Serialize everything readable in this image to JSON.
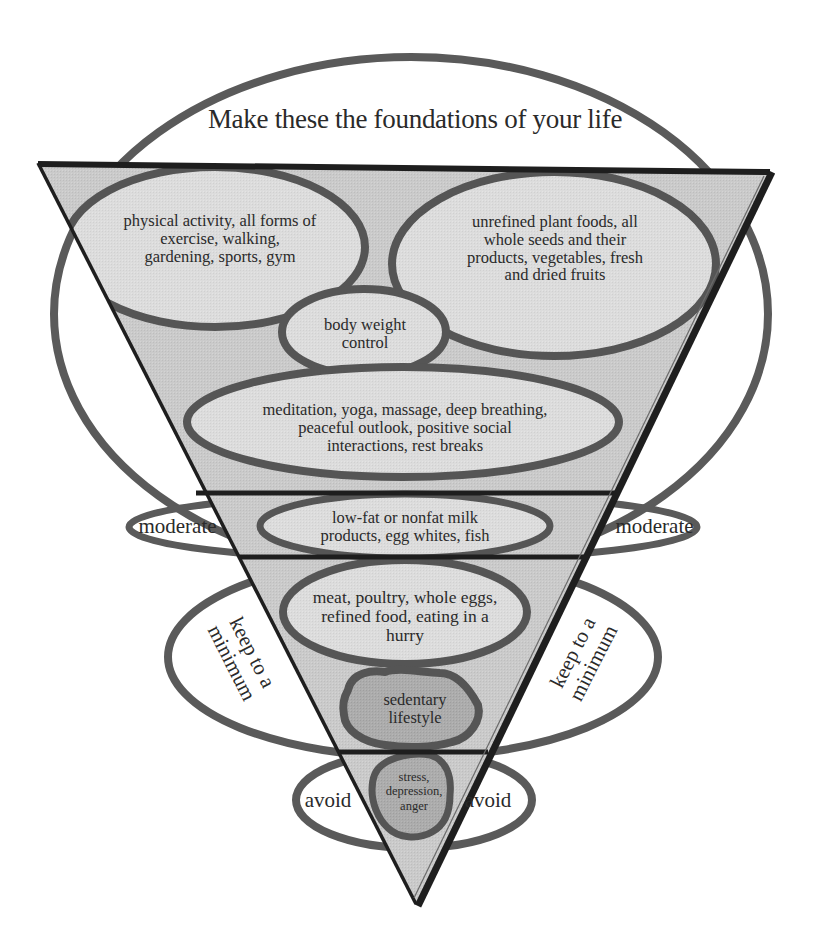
{
  "diagram": {
    "title": "Make these the foundations of your life",
    "colors": {
      "background": "#ffffff",
      "triangle_fill": "#c9c9c9",
      "triangle_edge": "#1e1e1e",
      "ellipse_stroke": "#555555",
      "inner_ellipse_fill": "#dadada",
      "warning_fill": "#a9a9a9",
      "text": "#2a2a2a"
    },
    "zones": [
      {
        "name": "foundations",
        "label": "Make these the foundations of your life",
        "items": [
          "physical activity, all forms of\nexercise, walking,\ngardening, sports, gym",
          "unrefined plant foods, all\nwhole seeds and their\nproducts, vegetables, fresh\nand dried fruits",
          "body weight\ncontrol",
          "meditation, yoga, massage, deep breathing,\npeaceful outlook, positive social\ninteractions, rest breaks"
        ]
      },
      {
        "name": "moderate",
        "side_label_left": "moderate",
        "side_label_right": "moderate",
        "items": [
          "low-fat or nonfat milk\nproducts, egg whites, fish"
        ]
      },
      {
        "name": "keep-to-a-minimum",
        "side_label_left": "keep to a\nminimum",
        "side_label_right": "keep to a\nminimum",
        "items": [
          "meat, poultry, whole eggs,\nrefined food, eating in a\nhurry",
          "sedentary\nlifestyle"
        ]
      },
      {
        "name": "avoid",
        "side_label_left": "avoid",
        "side_label_right": "avoid",
        "items": [
          "stress,\ndepression,\nanger"
        ]
      }
    ]
  }
}
